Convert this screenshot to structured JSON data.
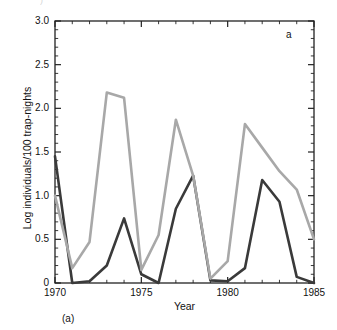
{
  "figure": {
    "panel_label_inside": "a",
    "panel_label_below": "(a)"
  },
  "artifact": {
    "top_cut_text": ")"
  },
  "axes": {
    "xlabel": "Year",
    "ylabel": "Log individuals/100 trap-nights",
    "ytick_labels": [
      "0",
      "0.5",
      "1.0",
      "1.5",
      "2.0",
      "2.5",
      "3.0"
    ],
    "xtick_labels": [
      "1970",
      "1975",
      "1980",
      "1985"
    ]
  },
  "colors": {
    "series_dark": "#3a3a3a",
    "series_light": "#a8a8a8",
    "axis": "#222222",
    "background": "#ffffff"
  },
  "chart_data": {
    "type": "line",
    "title": "",
    "subtitle": "",
    "xlabel": "Year",
    "ylabel": "Log individuals/100 trap-nights",
    "xlim": [
      1970,
      1985
    ],
    "ylim": [
      0,
      3.0
    ],
    "yticks": [
      0,
      0.5,
      1.0,
      1.5,
      2.0,
      2.5,
      3.0
    ],
    "xticks": [
      1970,
      1975,
      1980,
      1985
    ],
    "y_minor_tick_step": 0.1,
    "x_minor_tick_step": 1,
    "grid": false,
    "legend": null,
    "annotations": [
      "a",
      "(a)"
    ],
    "x": [
      1970,
      1971,
      1972,
      1973,
      1974,
      1975,
      1976,
      1977,
      1978,
      1979,
      1980,
      1981,
      1982,
      1983,
      1984,
      1985
    ],
    "series": [
      {
        "name": "dark",
        "color": "#3a3a3a",
        "values": [
          1.45,
          0.0,
          0.02,
          0.2,
          0.74,
          0.1,
          0.0,
          0.85,
          1.23,
          0.03,
          0.02,
          0.17,
          1.18,
          0.93,
          0.07,
          0.0
        ]
      },
      {
        "name": "light",
        "color": "#a8a8a8",
        "values": [
          1.0,
          0.17,
          0.47,
          2.18,
          2.12,
          0.15,
          0.55,
          1.87,
          1.23,
          0.05,
          0.25,
          1.82,
          1.55,
          1.28,
          1.07,
          0.5
        ]
      }
    ]
  }
}
